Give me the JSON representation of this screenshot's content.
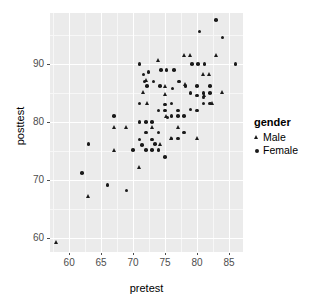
{
  "chart_data": {
    "type": "scatter",
    "title": "",
    "xlabel": "pretest",
    "ylabel": "posttest",
    "xlim": [
      57.0,
      87.2
    ],
    "ylim": [
      57.6,
      98.8
    ],
    "xticks": [
      60,
      65,
      70,
      75,
      80,
      85
    ],
    "yticks": [
      60,
      70,
      80,
      90
    ],
    "xtick_labels": [
      "60",
      "65",
      "70",
      "75",
      "80",
      "85"
    ],
    "ytick_labels": [
      "60",
      "70",
      "80",
      "90"
    ],
    "x_minor_ticks": [
      57.5,
      62.5,
      67.5,
      72.5,
      77.5,
      82.5,
      87.5
    ],
    "y_minor_ticks": [
      55,
      65,
      75,
      85,
      95
    ],
    "grid": true,
    "panel_background": "#ebebeb",
    "grid_major_color": "#ffffff",
    "grid_minor_color": "#f7f7f7",
    "point_color": "#1a1a1a",
    "legend_position": "right",
    "legend": {
      "title": "gender",
      "entries": [
        {
          "label": "Male",
          "marker": "triangle"
        },
        {
          "label": "Female",
          "marker": "circle"
        }
      ]
    },
    "series": [
      {
        "name": "Male",
        "marker": "triangle",
        "points": [
          [
            58.0,
            59.3
          ],
          [
            63.0,
            67.2
          ],
          [
            67.0,
            75.2
          ],
          [
            67.0,
            79.2
          ],
          [
            69.0,
            79.2
          ],
          [
            71.0,
            72.2
          ],
          [
            71.6,
            85.2
          ],
          [
            72.0,
            87.2
          ],
          [
            72.2,
            83.2
          ],
          [
            73.0,
            79.2
          ],
          [
            74.0,
            90.6
          ],
          [
            74.2,
            76.2
          ],
          [
            75.0,
            84.8
          ],
          [
            75.0,
            86.2
          ],
          [
            75.2,
            81.0
          ],
          [
            76.0,
            77.2
          ],
          [
            77.0,
            79.2
          ],
          [
            78.0,
            91.6
          ],
          [
            78.2,
            86.6
          ],
          [
            79.0,
            91.6
          ],
          [
            80.0,
            77.2
          ],
          [
            81.0,
            88.2
          ],
          [
            81.2,
            84.6
          ],
          [
            82.0,
            88.2
          ],
          [
            82.4,
            83.2
          ],
          [
            83.0,
            91.6
          ],
          [
            84.0,
            85.2
          ]
        ]
      },
      {
        "name": "Female",
        "marker": "circle",
        "points": [
          [
            62.0,
            71.2
          ],
          [
            63.0,
            76.2
          ],
          [
            66.0,
            69.2
          ],
          [
            67.0,
            81.0
          ],
          [
            69.0,
            68.2
          ],
          [
            70.0,
            75.2
          ],
          [
            71.0,
            77.0
          ],
          [
            71.0,
            80.0
          ],
          [
            71.0,
            83.2
          ],
          [
            71.0,
            90.0
          ],
          [
            71.4,
            76.0
          ],
          [
            71.6,
            88.2
          ],
          [
            71.8,
            87.0
          ],
          [
            72.0,
            75.2
          ],
          [
            72.0,
            78.2
          ],
          [
            72.0,
            80.0
          ],
          [
            72.2,
            86.2
          ],
          [
            72.4,
            88.6
          ],
          [
            73.0,
            75.2
          ],
          [
            73.0,
            77.0
          ],
          [
            73.0,
            80.0
          ],
          [
            73.2,
            87.0
          ],
          [
            73.4,
            76.2
          ],
          [
            74.0,
            75.2
          ],
          [
            74.0,
            78.2
          ],
          [
            74.0,
            82.0
          ],
          [
            74.2,
            86.2
          ],
          [
            74.4,
            89.0
          ],
          [
            75.0,
            74.0
          ],
          [
            75.0,
            82.0
          ],
          [
            75.0,
            83.0
          ],
          [
            75.2,
            89.0
          ],
          [
            75.4,
            80.8
          ],
          [
            76.0,
            77.2
          ],
          [
            76.0,
            81.0
          ],
          [
            76.0,
            83.2
          ],
          [
            76.2,
            85.8
          ],
          [
            76.4,
            89.0
          ],
          [
            77.0,
            77.2
          ],
          [
            77.0,
            81.0
          ],
          [
            77.0,
            82.0
          ],
          [
            77.2,
            87.0
          ],
          [
            78.0,
            78.2
          ],
          [
            78.0,
            81.0
          ],
          [
            78.2,
            86.2
          ],
          [
            79.0,
            82.2
          ],
          [
            79.0,
            85.0
          ],
          [
            79.2,
            90.0
          ],
          [
            80.0,
            82.0
          ],
          [
            80.0,
            84.6
          ],
          [
            80.0,
            86.2
          ],
          [
            80.2,
            90.0
          ],
          [
            80.4,
            95.6
          ],
          [
            81.0,
            83.2
          ],
          [
            81.0,
            84.2
          ],
          [
            81.0,
            85.0
          ],
          [
            81.2,
            90.0
          ],
          [
            82.0,
            83.2
          ],
          [
            82.0,
            85.0
          ],
          [
            82.0,
            86.2
          ],
          [
            83.0,
            97.6
          ],
          [
            84.0,
            94.6
          ],
          [
            86.0,
            90.0
          ]
        ]
      }
    ]
  }
}
